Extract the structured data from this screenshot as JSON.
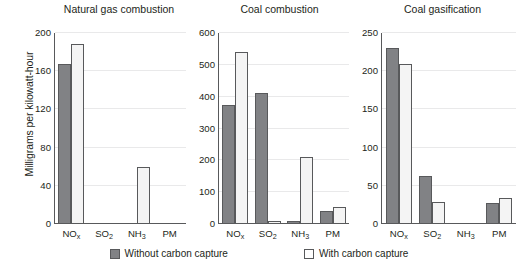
{
  "chart_data": {
    "type": "bar",
    "title": "",
    "ylabel": "Milligrams per kilowatt-hour",
    "xlabel": "",
    "grid": true,
    "legend_position": "bottom",
    "categories": [
      "NOx",
      "SO2",
      "NH3",
      "PM"
    ],
    "category_labels_html": [
      "NO<sub>x</sub>",
      "SO<sub>2</sub>",
      "NH<sub>3</sub>",
      "PM"
    ],
    "series_names": [
      "Without carbon capture",
      "With carbon capture"
    ],
    "series_colors": [
      "#818285",
      "#f4f4f4"
    ],
    "panels": [
      {
        "title": "Natural gas combustion",
        "ylim": [
          0,
          200
        ],
        "yticks": [
          0,
          40,
          80,
          120,
          160,
          200
        ],
        "ytick_labels": [
          "0",
          "40",
          "80",
          "120",
          "160",
          "200"
        ],
        "series": [
          {
            "name": "Without carbon capture",
            "values": [
              168,
              0,
              0,
              0
            ]
          },
          {
            "name": "With carbon capture",
            "values": [
              188,
              0,
              60,
              0
            ]
          }
        ]
      },
      {
        "title": "Coal combustion",
        "ylim": [
          0,
          600
        ],
        "yticks": [
          0,
          100,
          200,
          300,
          400,
          500,
          600
        ],
        "ytick_labels": [
          "0",
          "100",
          "200",
          "300",
          "400",
          "500",
          "600"
        ],
        "series": [
          {
            "name": "Without carbon capture",
            "values": [
              375,
              413,
              8,
              40
            ]
          },
          {
            "name": "With carbon capture",
            "values": [
              540,
              10,
              210,
              53
            ]
          }
        ]
      },
      {
        "title": "Coal gasification",
        "ylim": [
          0,
          250
        ],
        "yticks": [
          0,
          50,
          100,
          150,
          200,
          250
        ],
        "ytick_labels": [
          "0",
          "50",
          "100",
          "150",
          "200",
          "250"
        ],
        "series": [
          {
            "name": "Without carbon capture",
            "values": [
              230,
              63,
              0,
              28
            ]
          },
          {
            "name": "With carbon capture",
            "values": [
              209,
              29,
              0,
              34
            ]
          }
        ]
      }
    ]
  },
  "legend": {
    "items": [
      {
        "label": "Without carbon capture",
        "style": "dark"
      },
      {
        "label": "With carbon capture",
        "style": "light"
      }
    ]
  }
}
